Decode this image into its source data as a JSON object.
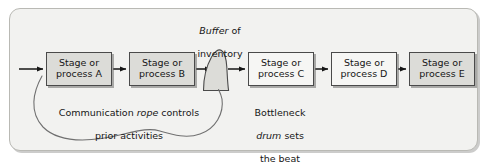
{
  "figure": {
    "panel": {
      "background": "#f2f2f0",
      "border_color": "#b9b9b4"
    },
    "colors": {
      "box_fill": "#dcdcd8",
      "box_fill_light": "#f6f6f4",
      "box_stroke": "#4a4a4a",
      "arrow": "#161616",
      "rope": "#707070",
      "text": "#161616"
    }
  },
  "stages": [
    {
      "id": "a",
      "line1": "Stage or",
      "line2": "process A",
      "x": 46,
      "y": 52,
      "fill": "dark"
    },
    {
      "id": "b",
      "line1": "Stage or",
      "line2": "process B",
      "x": 129,
      "y": 52,
      "fill": "dark"
    },
    {
      "id": "c",
      "line1": "Stage or",
      "line2": "process C",
      "x": 248,
      "y": 52,
      "fill": "light"
    },
    {
      "id": "d",
      "line1": "Stage or",
      "line2": "process D",
      "x": 331,
      "y": 52,
      "fill": "light"
    },
    {
      "id": "e",
      "line1": "Stage or",
      "line2": "process E",
      "x": 409,
      "y": 52,
      "fill": "dark"
    }
  ],
  "buffer": {
    "label_italic": "Buffer",
    "label_rest": " of",
    "label_line2": "inventory",
    "shape": "inventory-pile"
  },
  "captions": {
    "rope": {
      "pre": "Communication ",
      "italic": "rope",
      "post": " controls",
      "line2": "prior activities"
    },
    "drum": {
      "line1": "Bottleneck",
      "italic": "drum",
      "post": " sets",
      "line3": "the beat"
    }
  }
}
